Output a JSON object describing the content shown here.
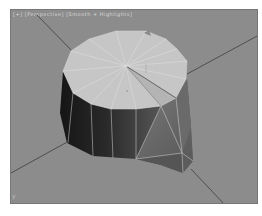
{
  "viewport": {
    "label": "[+] [Perspective] [Smooth + Highlights]",
    "background": "#8c8c8c",
    "axis_indicator": "y"
  },
  "scene": {
    "object": "cylinder-mesh",
    "cap_color": "#c6c6c6",
    "side_dark_color": "#202020",
    "side_mid_color": "#5a5a5a",
    "edge_color": "#e2e2e2",
    "grid_color": "#505050"
  }
}
